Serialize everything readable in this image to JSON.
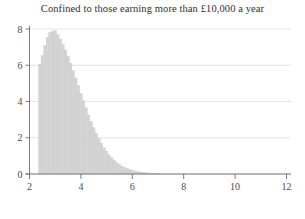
{
  "chart_data": {
    "type": "bar",
    "title": "Confined to those earning more than £10,000 a year",
    "xlabel": "",
    "ylabel": "",
    "xlim": [
      2,
      12
    ],
    "ylim": [
      0,
      8
    ],
    "grid": true,
    "legend": null,
    "bar_color": "#d4d4d4",
    "axis_color": "#6e6e6e",
    "grid_color": "#d9d9d9",
    "xticks": [
      2,
      4,
      6,
      8,
      10,
      12
    ],
    "xtick_labels": [
      "2",
      "4",
      "6",
      "8",
      "10",
      "12"
    ],
    "yticks": [
      0,
      2,
      4,
      6,
      8
    ],
    "ytick_labels": [
      "0",
      "2",
      "4",
      "6",
      "8"
    ],
    "bin_width": 0.1,
    "x": [
      2.4,
      2.5,
      2.6,
      2.7,
      2.8,
      2.9,
      3.0,
      3.1,
      3.2,
      3.3,
      3.4,
      3.5,
      3.6,
      3.7,
      3.8,
      3.9,
      4.0,
      4.1,
      4.2,
      4.3,
      4.4,
      4.5,
      4.6,
      4.7,
      4.8,
      4.9,
      5.0,
      5.1,
      5.2,
      5.3,
      5.4,
      5.5,
      5.6,
      5.7,
      5.8,
      5.9,
      6.0,
      6.1,
      6.2,
      6.3,
      6.4,
      6.5,
      6.6,
      6.7,
      6.8,
      6.9,
      7.0
    ],
    "values": [
      6.05,
      6.55,
      7.1,
      7.55,
      7.8,
      7.88,
      7.9,
      7.7,
      7.45,
      7.15,
      6.85,
      6.5,
      6.1,
      5.7,
      5.3,
      4.9,
      4.45,
      4.05,
      3.65,
      3.25,
      2.9,
      2.55,
      2.25,
      1.95,
      1.7,
      1.45,
      1.25,
      1.05,
      0.9,
      0.75,
      0.62,
      0.52,
      0.43,
      0.36,
      0.3,
      0.25,
      0.2,
      0.17,
      0.14,
      0.11,
      0.09,
      0.08,
      0.06,
      0.05,
      0.04,
      0.03,
      0.02
    ]
  }
}
